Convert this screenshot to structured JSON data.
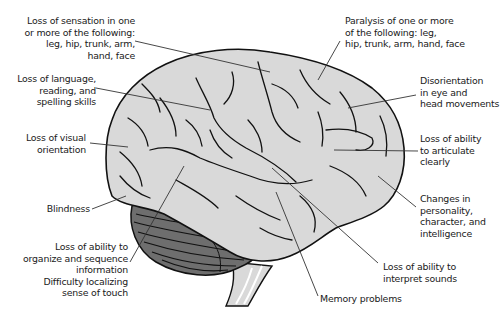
{
  "diagram": {
    "labels": [
      {
        "id": "sensation",
        "text": "Loss of sensation in one\nor more of the following:\nleg, hip, trunk, arm,\nhand, face"
      },
      {
        "id": "paralysis",
        "text": "Paralysis of one or more\nof the following: leg,\nhip, trunk, arm, hand, face"
      },
      {
        "id": "language",
        "text": "Loss of language,\nreading, and\nspelling skills"
      },
      {
        "id": "disorientation",
        "text": "Disorientation\nin eye and\nhead movements"
      },
      {
        "id": "visual",
        "text": "Loss of visual\norientation"
      },
      {
        "id": "articulate",
        "text": "Loss of ability\nto articulate\nclearly"
      },
      {
        "id": "blindness",
        "text": "Blindness"
      },
      {
        "id": "personality",
        "text": "Changes in\npersonality,\ncharacter, and\nintelligence"
      },
      {
        "id": "organize",
        "text": "Loss of ability to\norganize and sequence\ninformation\nDifficulty localizing\nsense of touch"
      },
      {
        "id": "sounds",
        "text": "Loss of ability to\ninterpret sounds"
      },
      {
        "id": "memory",
        "text": "Memory problems"
      }
    ],
    "colors": {
      "cerebrum": "#d9d9d9",
      "cerebellum": "#6e6e6e",
      "outline": "#111111",
      "leader": "#333333",
      "background": "#ffffff"
    }
  }
}
